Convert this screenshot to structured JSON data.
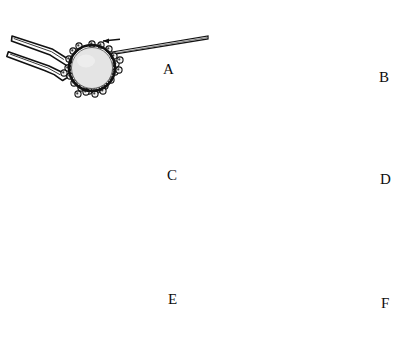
{
  "figure": {
    "title": "(view from above)",
    "view_note": "view from above",
    "background_color": "#ffffff",
    "ink_color": "#111111",
    "oocyte_fill": "#e2e2e2",
    "zona_color": "#111111",
    "panel_count": 6
  },
  "panels": [
    {
      "id": "A",
      "label": "A",
      "label_x": 163,
      "label_y": 62,
      "origin_x": 0,
      "origin_y": 25,
      "oocyte": {
        "cx": 92,
        "cy": 68,
        "r": 22
      },
      "holder": {
        "type": "holding-pipette",
        "side": "left",
        "prongs": 2
      },
      "needle": {
        "type": "injection-needle",
        "side": "right",
        "angle_deg": -9
      },
      "arrows": [
        {
          "name": "needle-advance-arrow",
          "direction": "left",
          "x": 112,
          "y": 41,
          "style": "single"
        }
      ],
      "step_description": "Needle approaches oocyte held by pipette"
    },
    {
      "id": "B",
      "label": "B",
      "label_x": 379,
      "label_y": 70,
      "origin_x": 204,
      "origin_y": 25,
      "oocyte": {
        "cx": 302,
        "cy": 70,
        "r": 22
      },
      "holder": {
        "type": "holding-pipette",
        "side": "left",
        "prongs": 2
      },
      "needle": {
        "type": "injection-needle",
        "side": "right",
        "angle_deg": -9
      },
      "arrows": [
        {
          "name": "needle-advance-arrow",
          "direction": "left",
          "x": 328,
          "y": 38,
          "style": "single"
        }
      ],
      "overlay": {
        "name": "zona-slit-hook",
        "shape": "curved-loop"
      },
      "step_description": "Needle passes through zona pellucida forming a loop"
    },
    {
      "id": "C",
      "label": "C",
      "label_x": 167,
      "label_y": 168,
      "origin_x": 0,
      "origin_y": 130,
      "oocyte": {
        "cx": 92,
        "cy": 173,
        "r": 22
      },
      "holder": {
        "type": "holding-pipette",
        "side": "left",
        "prongs": 2
      },
      "needle": {
        "type": "injection-needle",
        "side": "right",
        "angle_deg": -9
      },
      "arrows": [
        {
          "name": "lateral-rub-arrow",
          "direction": "double-horizontal",
          "x": 113,
          "y": 145,
          "style": "double"
        }
      ],
      "step_description": "Lateral rubbing motion of needle against holding pipette"
    },
    {
      "id": "D",
      "label": "D",
      "label_x": 380,
      "label_y": 172,
      "origin_x": 204,
      "origin_y": 130,
      "oocyte": {
        "cx": 302,
        "cy": 175,
        "r": 24
      },
      "holder": {
        "type": "holding-pipette",
        "side": "left",
        "prongs": 2
      },
      "needle": {
        "type": "injection-needle",
        "side": "right",
        "angle_deg": -9
      },
      "arrows": [
        {
          "name": "needle-retract-arrow",
          "direction": "left",
          "x": 330,
          "y": 152,
          "style": "single"
        },
        {
          "name": "pipette-release-arrow",
          "direction": "left",
          "x": 263,
          "y": 168,
          "style": "single"
        }
      ],
      "step_description": "Needle and pipette move apart cutting the zona"
    },
    {
      "id": "E",
      "label": "E",
      "label_x": 168,
      "label_y": 292,
      "origin_x": 0,
      "origin_y": 235,
      "oocyte": {
        "cx": 88,
        "cy": 306,
        "r": 27
      },
      "holder": {
        "type": "holding-pipette",
        "side": "left",
        "prongs": 2
      },
      "needle": {
        "type": "injection-needle",
        "side": "right",
        "angle_deg": -7
      },
      "arrows": [
        {
          "name": "horizontal-shear-arrow",
          "direction": "double-horizontal",
          "x": 90,
          "y": 254,
          "style": "double"
        },
        {
          "name": "vertical-shear-arrow",
          "direction": "double-vertical",
          "x": 128,
          "y": 280,
          "style": "double"
        }
      ],
      "step_description": "Oocyte rolled down; shearing in two directions"
    },
    {
      "id": "F",
      "label": "F",
      "label_x": 381,
      "label_y": 296,
      "origin_x": 204,
      "origin_y": 235,
      "oocyte": {
        "cx": 305,
        "cy": 310,
        "r": 27
      },
      "holder": {
        "type": "holding-pipette",
        "side": "left",
        "prongs": 2
      },
      "needle": {
        "type": "injection-needle",
        "side": "right",
        "angle_deg": -7
      },
      "arrows": [
        {
          "name": "needle-lift-arrow",
          "direction": "up",
          "x": 367,
          "y": 258,
          "style": "single"
        },
        {
          "name": "pipette-withdraw-arrow",
          "direction": "left",
          "x": 226,
          "y": 288,
          "style": "single"
        }
      ],
      "step_description": "Needle lifted away; pipette withdrawn"
    }
  ]
}
